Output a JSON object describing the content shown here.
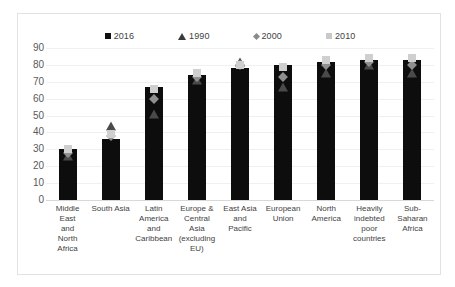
{
  "chart_data": {
    "type": "bar",
    "title": "",
    "xlabel": "",
    "ylabel": "",
    "ylim": [
      0,
      90
    ],
    "yticks": [
      90,
      80,
      70,
      60,
      50,
      40,
      30,
      20,
      10,
      0
    ],
    "grid": true,
    "legend_position": "top",
    "categories": [
      "Middle East and North Africa",
      "South Asia",
      "Latin America and Caribbean",
      "Europe & Central Asia (excluding EU)",
      "East Asia and Pacific",
      "European Union",
      "North America",
      "Heavily indebted poor countries",
      "Sub-Saharan Africa"
    ],
    "category_lines": [
      [
        "Middle",
        "East",
        "and",
        "North",
        "Africa"
      ],
      [
        "South Asia"
      ],
      [
        "Latin",
        "America",
        "and",
        "Caribbean"
      ],
      [
        "Europe &",
        "Central",
        "Asia",
        "(excluding",
        "EU)"
      ],
      [
        "East Asia",
        "and",
        "Pacific"
      ],
      [
        "European",
        "Union"
      ],
      [
        "North",
        "America"
      ],
      [
        "Heavily",
        "indebted",
        "poor",
        "countries"
      ],
      [
        "Sub-",
        "Saharan",
        "Africa"
      ]
    ],
    "series": [
      {
        "name": "2016",
        "marker": "square",
        "color": "#0d0d0d",
        "values": [
          30,
          36,
          67,
          74,
          78,
          80,
          82,
          83,
          83
        ]
      },
      {
        "name": "1990",
        "marker": "triangle",
        "color": "#4a4a4a",
        "values": [
          26,
          44,
          51,
          71,
          82,
          67,
          75,
          80,
          75
        ]
      },
      {
        "name": "2000",
        "marker": "diamond",
        "color": "#8f8f8f",
        "values": [
          28,
          38,
          60,
          73,
          80,
          73,
          80,
          82,
          80
        ]
      },
      {
        "name": "2010",
        "marker": "square-light",
        "color": "#cfcfcf",
        "values": [
          30,
          39,
          66,
          75,
          80,
          79,
          83,
          84,
          84
        ]
      }
    ]
  },
  "legend": {
    "items": [
      {
        "label": "2016",
        "marker": "square-dark-icon"
      },
      {
        "label": "1990",
        "marker": "triangle-dark-icon"
      },
      {
        "label": "2000",
        "marker": "diamond-gray-icon"
      },
      {
        "label": "2010",
        "marker": "square-light-icon"
      }
    ]
  },
  "colors": {
    "series_2016": "#0d0d0d",
    "series_1990": "#4a4a4a",
    "series_2000": "#8f8f8f",
    "series_2010": "#cfcfcf",
    "grid": "#f0f0f0",
    "frame": "#e2e2e2",
    "text": "#3f3f3f"
  }
}
